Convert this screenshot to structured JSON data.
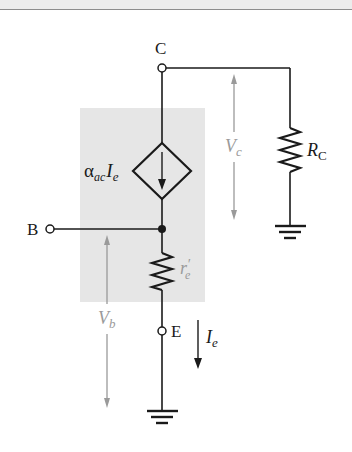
{
  "diagram": {
    "type": "transistor ac equivalent circuit (common-base model)",
    "colors": {
      "wire": "#1a1a1a",
      "shaded_region": "#e6e6e6",
      "voltage_arrow": "#9a9a9a",
      "voltage_label": "#9a9a9a"
    },
    "terminals": {
      "collector": "C",
      "base": "B",
      "emitter": "E"
    },
    "labels": {
      "current_source_alpha": "α",
      "current_source_alpha_sub": "ac",
      "current_source_I": "I",
      "current_source_I_sub": "e",
      "re_main": "r",
      "re_prime": "′",
      "re_sub": "e",
      "rc_main": "R",
      "rc_sub": "C",
      "vc_main": "V",
      "vc_sub": "c",
      "vb_main": "V",
      "vb_sub": "b",
      "ie_main": "I",
      "ie_sub": "e"
    },
    "components": [
      {
        "name": "dependent-current-source",
        "label": "αac·Ie",
        "direction": "down"
      },
      {
        "name": "emitter-resistance",
        "label": "r′e"
      },
      {
        "name": "collector-resistor",
        "label": "RC"
      },
      {
        "name": "ground-emitter"
      },
      {
        "name": "ground-collector"
      }
    ]
  }
}
